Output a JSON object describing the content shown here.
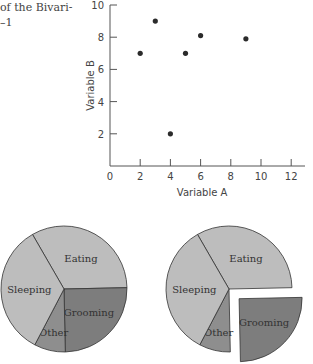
{
  "caption": {
    "line1": "of the Bivari-",
    "line2": "–1"
  },
  "chart_data": [
    {
      "type": "scatter",
      "title": "",
      "xlabel": "Variable A",
      "ylabel": "Variable B",
      "xlim": [
        0,
        12.6
      ],
      "ylim": [
        0,
        10
      ],
      "xticks": [
        0,
        2,
        4,
        6,
        8,
        10,
        12
      ],
      "yticks": [
        2,
        4,
        6,
        8,
        10
      ],
      "grid": false,
      "points": [
        {
          "x": 2,
          "y": 7
        },
        {
          "x": 3,
          "y": 9
        },
        {
          "x": 4,
          "y": 2
        },
        {
          "x": 5,
          "y": 7
        },
        {
          "x": 6,
          "y": 8.1
        },
        {
          "x": 9,
          "y": 7.9
        }
      ]
    },
    {
      "type": "pie",
      "title": "",
      "exploded": null,
      "slices": [
        {
          "label": "Eating",
          "value": 33,
          "color": "#bdbdbd"
        },
        {
          "label": "Grooming",
          "value": 25,
          "color": "#7d7d7d"
        },
        {
          "label": "Other",
          "value": 8,
          "color": "#8e8e8e"
        },
        {
          "label": "Sleeping",
          "value": 34,
          "color": "#bdbdbd"
        }
      ]
    },
    {
      "type": "pie",
      "title": "",
      "exploded": "Grooming",
      "slices": [
        {
          "label": "Eating",
          "value": 33,
          "color": "#bdbdbd"
        },
        {
          "label": "Grooming",
          "value": 25,
          "color": "#7d7d7d"
        },
        {
          "label": "Other",
          "value": 8,
          "color": "#8e8e8e"
        },
        {
          "label": "Sleeping",
          "value": 34,
          "color": "#bdbdbd"
        }
      ]
    }
  ]
}
